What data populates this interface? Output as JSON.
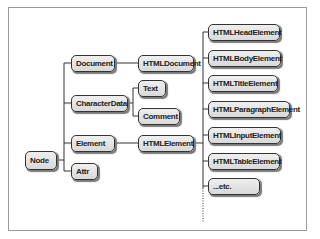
{
  "diagram": {
    "type": "class-hierarchy",
    "colors": {
      "box_fill": "#e3e3e3",
      "box_border": "#333333",
      "line": "#333333",
      "frame": "#9a9a9a"
    },
    "nodes": {
      "node": "Node",
      "document": "Document",
      "character_data": "CharacterData",
      "element": "Element",
      "attr": "Attr",
      "html_document": "HTMLDocument",
      "text": "Text",
      "comment": "Comment",
      "html_element": "HTMLElement",
      "html_head_element": "HTMLHeadElement",
      "html_body_element": "HTMLBodyElement",
      "html_title_element": "HTMLTitleElement",
      "html_paragraph_element": "HTMLParagraphElement",
      "html_input_element": "HTMLInputElement",
      "html_table_element": "HTMLTableElement",
      "etc": "...etc."
    },
    "edges": [
      [
        "Node",
        "Document"
      ],
      [
        "Node",
        "CharacterData"
      ],
      [
        "Node",
        "Element"
      ],
      [
        "Node",
        "Attr"
      ],
      [
        "Document",
        "HTMLDocument"
      ],
      [
        "CharacterData",
        "Text"
      ],
      [
        "CharacterData",
        "Comment"
      ],
      [
        "Element",
        "HTMLElement"
      ],
      [
        "HTMLElement",
        "HTMLHeadElement"
      ],
      [
        "HTMLElement",
        "HTMLBodyElement"
      ],
      [
        "HTMLElement",
        "HTMLTitleElement"
      ],
      [
        "HTMLElement",
        "HTMLParagraphElement"
      ],
      [
        "HTMLElement",
        "HTMLInputElement"
      ],
      [
        "HTMLElement",
        "HTMLTableElement"
      ],
      [
        "HTMLElement",
        "...etc."
      ]
    ]
  }
}
